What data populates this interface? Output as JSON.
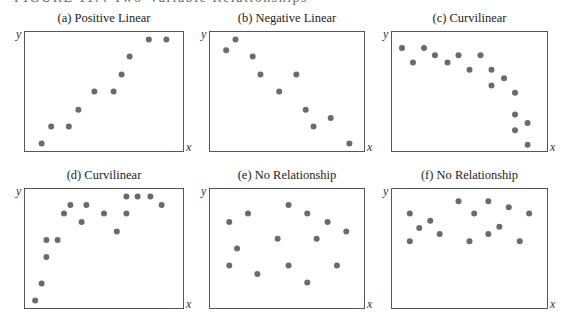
{
  "figure": {
    "header": "FIGURE 11.4  Two-Variable Relationships"
  },
  "style": {
    "point_color": "#6b6b6b",
    "border_color": "#555555"
  },
  "chart_data": [
    {
      "type": "scatter",
      "title": "(a) Positive Linear",
      "xlabel": "x",
      "ylabel": "y",
      "xlim": [
        0,
        10
      ],
      "ylim": [
        0,
        10
      ],
      "grid": false,
      "ticks": false,
      "points": [
        [
          1.1,
          0.7
        ],
        [
          1.7,
          2.1
        ],
        [
          2.8,
          2.1
        ],
        [
          3.4,
          3.5
        ],
        [
          4.4,
          5.0
        ],
        [
          5.6,
          5.0
        ],
        [
          6.1,
          6.4
        ],
        [
          6.6,
          7.9
        ],
        [
          7.8,
          9.3
        ],
        [
          8.9,
          9.3
        ]
      ]
    },
    {
      "type": "scatter",
      "title": "(b) Negative Linear",
      "xlabel": "x",
      "ylabel": "y",
      "xlim": [
        0,
        10
      ],
      "ylim": [
        0,
        10
      ],
      "grid": false,
      "ticks": false,
      "points": [
        [
          1.1,
          8.4
        ],
        [
          1.7,
          9.3
        ],
        [
          2.8,
          7.9
        ],
        [
          3.3,
          6.4
        ],
        [
          4.5,
          5.0
        ],
        [
          5.6,
          6.4
        ],
        [
          6.2,
          3.5
        ],
        [
          6.7,
          2.1
        ],
        [
          7.8,
          2.8
        ],
        [
          9.0,
          0.7
        ]
      ]
    },
    {
      "type": "scatter",
      "title": "(c) Curvilinear",
      "xlabel": "x",
      "ylabel": "y",
      "xlim": [
        0,
        10
      ],
      "ylim": [
        0,
        10
      ],
      "grid": false,
      "ticks": false,
      "points": [
        [
          0.7,
          8.6
        ],
        [
          1.4,
          7.4
        ],
        [
          2.1,
          8.6
        ],
        [
          2.8,
          8.0
        ],
        [
          3.6,
          7.4
        ],
        [
          4.3,
          8.0
        ],
        [
          5.0,
          6.8
        ],
        [
          5.7,
          8.0
        ],
        [
          6.4,
          6.8
        ],
        [
          6.4,
          5.5
        ],
        [
          7.2,
          6.1
        ],
        [
          7.9,
          4.9
        ],
        [
          7.9,
          3.1
        ],
        [
          7.9,
          1.8
        ],
        [
          8.7,
          2.4
        ],
        [
          8.7,
          0.6
        ]
      ]
    },
    {
      "type": "scatter",
      "title": "(d) Curvilinear",
      "xlabel": "x",
      "ylabel": "y",
      "xlim": [
        0,
        10
      ],
      "ylim": [
        0,
        10
      ],
      "grid": false,
      "ticks": false,
      "points": [
        [
          0.7,
          0.7
        ],
        [
          1.1,
          2.1
        ],
        [
          1.4,
          4.3
        ],
        [
          1.4,
          5.7
        ],
        [
          2.1,
          5.7
        ],
        [
          2.5,
          7.9
        ],
        [
          2.9,
          8.6
        ],
        [
          3.6,
          7.2
        ],
        [
          3.9,
          8.6
        ],
        [
          5.0,
          7.9
        ],
        [
          5.8,
          6.4
        ],
        [
          6.4,
          9.3
        ],
        [
          6.4,
          7.9
        ],
        [
          7.1,
          9.3
        ],
        [
          7.9,
          9.3
        ],
        [
          8.6,
          8.6
        ]
      ]
    },
    {
      "type": "scatter",
      "title": "(e) No Relationship",
      "xlabel": "x",
      "ylabel": "y",
      "xlim": [
        0,
        10
      ],
      "ylim": [
        0,
        10
      ],
      "grid": false,
      "ticks": false,
      "points": [
        [
          1.3,
          7.2
        ],
        [
          1.8,
          5.0
        ],
        [
          1.3,
          3.6
        ],
        [
          2.5,
          7.9
        ],
        [
          3.1,
          2.9
        ],
        [
          4.4,
          5.8
        ],
        [
          5.1,
          8.6
        ],
        [
          5.1,
          3.6
        ],
        [
          6.3,
          7.9
        ],
        [
          6.3,
          2.2
        ],
        [
          6.9,
          5.8
        ],
        [
          7.6,
          7.2
        ],
        [
          8.2,
          3.6
        ],
        [
          8.8,
          6.4
        ]
      ]
    },
    {
      "type": "scatter",
      "title": "(f) No Relationship",
      "xlabel": "x",
      "ylabel": "y",
      "xlim": [
        0,
        10
      ],
      "ylim": [
        0,
        10
      ],
      "grid": false,
      "ticks": false,
      "points": [
        [
          1.2,
          7.9
        ],
        [
          1.2,
          5.6
        ],
        [
          1.8,
          6.7
        ],
        [
          2.5,
          7.3
        ],
        [
          3.1,
          6.2
        ],
        [
          4.3,
          8.9
        ],
        [
          5.0,
          5.6
        ],
        [
          5.3,
          7.9
        ],
        [
          6.2,
          8.9
        ],
        [
          6.2,
          6.2
        ],
        [
          6.9,
          6.8
        ],
        [
          7.5,
          8.4
        ],
        [
          8.2,
          5.6
        ],
        [
          8.8,
          7.9
        ]
      ]
    }
  ]
}
